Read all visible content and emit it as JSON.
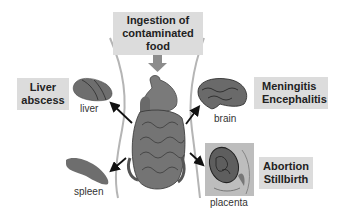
{
  "diagram": {
    "entry": {
      "lines": [
        "Ingestion of",
        "contaminated",
        "food"
      ]
    },
    "outcomes": [
      {
        "id": "liver",
        "box_lines": [
          "Liver",
          "abscess"
        ],
        "organ_label": "liver"
      },
      {
        "id": "brain",
        "box_lines": [
          "Meningitis",
          "Encephalitis"
        ],
        "organ_label": "brain"
      },
      {
        "id": "spleen",
        "box_lines": [],
        "organ_label": "spleen"
      },
      {
        "id": "placenta",
        "box_lines": [
          "Abortion",
          "Stillbirth"
        ],
        "organ_label": "placenta"
      }
    ],
    "colors": {
      "label_box": "#dcdcdc",
      "organ_fill": "#6e6e6e",
      "body_outline": "#b5b5b5",
      "arrow": "#111111",
      "entry_arrow": "#8c8c8c"
    }
  }
}
